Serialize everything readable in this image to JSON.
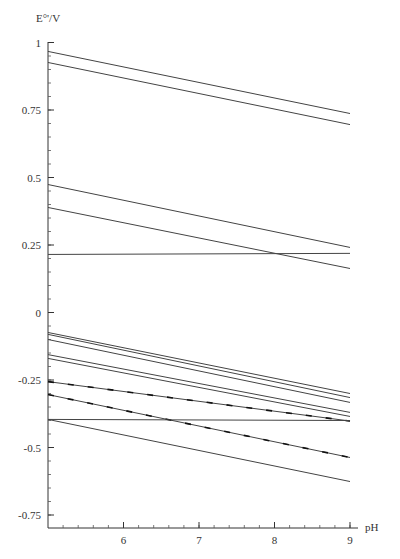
{
  "chart_data": {
    "type": "line",
    "title": "",
    "xlabel": "pH",
    "ylabel": "E°'/V",
    "xlim": [
      5.0,
      9.1
    ],
    "ylim": [
      -0.8,
      1.0
    ],
    "xticks": [
      6,
      7,
      8,
      9
    ],
    "xtick_labels": [
      "6",
      "7",
      "8",
      "9"
    ],
    "yticks": [
      1,
      0.75,
      0.5,
      0.25,
      0,
      -0.25,
      -0.5,
      -0.75
    ],
    "ytick_labels": [
      "1",
      "0.75",
      "0.5",
      "0.25",
      "0",
      "-0.25",
      "-0.5",
      "-0.75"
    ],
    "grid": false,
    "legend": null,
    "x": [
      5.0,
      9.0
    ],
    "series": [
      {
        "name": "line-1",
        "values": [
          0.967,
          0.737
        ],
        "style": "solid"
      },
      {
        "name": "line-2",
        "values": [
          0.926,
          0.696
        ],
        "style": "solid"
      },
      {
        "name": "line-3",
        "values": [
          0.474,
          0.241
        ],
        "style": "solid"
      },
      {
        "name": "line-4",
        "values": [
          0.389,
          0.163
        ],
        "style": "solid"
      },
      {
        "name": "line-5",
        "values": [
          0.215,
          0.219
        ],
        "style": "solid"
      },
      {
        "name": "line-6",
        "values": [
          -0.074,
          -0.3
        ],
        "style": "solid"
      },
      {
        "name": "line-7",
        "values": [
          -0.081,
          -0.315
        ],
        "style": "solid"
      },
      {
        "name": "line-8",
        "values": [
          -0.1,
          -0.333
        ],
        "style": "solid"
      },
      {
        "name": "line-9",
        "values": [
          -0.156,
          -0.37
        ],
        "style": "solid"
      },
      {
        "name": "line-10",
        "values": [
          -0.17,
          -0.385
        ],
        "style": "solid"
      },
      {
        "name": "line-11",
        "values": [
          -0.256,
          -0.402
        ],
        "style": "dashed-bold"
      },
      {
        "name": "line-12",
        "values": [
          -0.304,
          -0.537
        ],
        "style": "dashed-bold"
      },
      {
        "name": "line-13",
        "values": [
          -0.396,
          -0.4
        ],
        "style": "solid"
      },
      {
        "name": "line-14",
        "values": [
          -0.396,
          -0.626
        ],
        "style": "solid"
      }
    ]
  }
}
